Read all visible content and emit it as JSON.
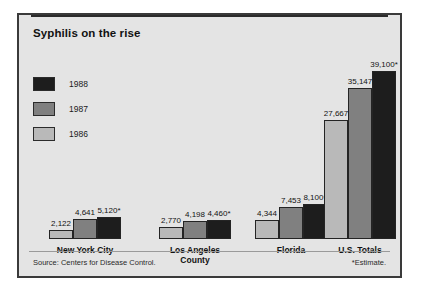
{
  "figure": {
    "title": "Syphilis on the rise",
    "background_color": "#e4e4e4",
    "border_color": "#3a3a3a",
    "source_note": "Source: Centers for Disease Control.",
    "estimate_note": "*Estimate."
  },
  "legend": {
    "position": "upper-left",
    "entries": [
      {
        "label": "1988",
        "color": "#1d1d1d"
      },
      {
        "label": "1987",
        "color": "#808080"
      },
      {
        "label": "1986",
        "color": "#b9b9b9"
      }
    ]
  },
  "chart_data": {
    "type": "bar",
    "title": "Syphilis on the rise",
    "xlabel": "",
    "ylabel": "",
    "ylim": [
      0,
      39100
    ],
    "grid": false,
    "legend_position": "upper-left",
    "categories": [
      "New York City",
      "Los Angeles County",
      "Florida",
      "U.S. Totals"
    ],
    "series": [
      {
        "name": "1986",
        "color": "#b9b9b9",
        "values": [
          2122,
          2770,
          4344,
          27667
        ],
        "labels": [
          "2,122",
          "2,770",
          "4,344",
          "27,667"
        ]
      },
      {
        "name": "1987",
        "color": "#808080",
        "values": [
          4641,
          4198,
          7453,
          35147
        ],
        "labels": [
          "4,641",
          "4,198",
          "7,453",
          "35,147"
        ]
      },
      {
        "name": "1988",
        "color": "#1d1d1d",
        "values": [
          5120,
          4460,
          8100,
          39100
        ],
        "labels": [
          "5,120*",
          "4,460*",
          "8,100*",
          "39,100*"
        ]
      }
    ],
    "annotations": [
      "*Estimate."
    ],
    "source": "Source: Centers for Disease Control."
  }
}
